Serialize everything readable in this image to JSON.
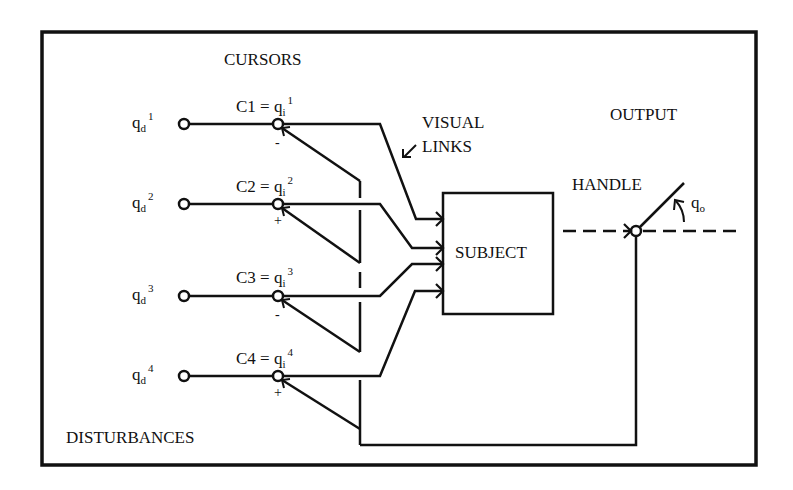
{
  "figure": {
    "labels": {
      "cursors": "CURSORS",
      "visual_links_line1": "VISUAL",
      "visual_links_line2": "LINKS",
      "visual_links_arrow": "↙",
      "output": "OUTPUT",
      "handle": "HANDLE",
      "subject": "SUBJECT",
      "disturbances": "DISTURBANCES",
      "handle_angle_base": "q",
      "handle_angle_sub": "o",
      "handle_angle_arrow": "↰"
    },
    "disturbances": [
      {
        "base": "q",
        "sub": "d",
        "sup": "1"
      },
      {
        "base": "q",
        "sub": "d",
        "sup": "2"
      },
      {
        "base": "q",
        "sub": "d",
        "sup": "3"
      },
      {
        "base": "q",
        "sub": "d",
        "sup": "4"
      }
    ],
    "cursors": [
      {
        "name": "C1",
        "eq": " = ",
        "base": "q",
        "sub": "i",
        "sup": "1",
        "sign": "-"
      },
      {
        "name": "C2",
        "eq": " = ",
        "base": "q",
        "sub": "i",
        "sup": "2",
        "sign": "+"
      },
      {
        "name": "C3",
        "eq": " = ",
        "base": "q",
        "sub": "i",
        "sup": "3",
        "sign": "-"
      },
      {
        "name": "C4",
        "eq": " = ",
        "base": "q",
        "sub": "i",
        "sup": "4",
        "sign": "+"
      }
    ],
    "colors": {
      "ink": "#111111",
      "background": "#ffffff"
    }
  }
}
